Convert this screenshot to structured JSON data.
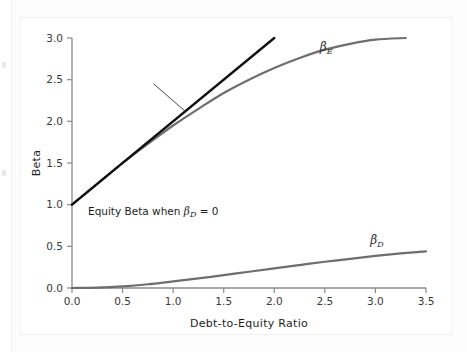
{
  "figure": {
    "background_color": "#ffffff",
    "frame_color": "#efefef"
  },
  "chart_data": {
    "type": "line",
    "title": "",
    "xlabel": "Debt-to-Equity Ratio",
    "ylabel": "Beta",
    "xlim": [
      0.0,
      3.5
    ],
    "ylim": [
      0.0,
      3.0
    ],
    "xticks": [
      "0.0",
      "0.5",
      "1.0",
      "1.5",
      "2.0",
      "2.5",
      "3.0",
      "3.5"
    ],
    "yticks": [
      "0.0",
      "0.5",
      "1.0",
      "1.5",
      "2.0",
      "2.5",
      "3.0"
    ],
    "xtick_values": [
      0.0,
      0.5,
      1.0,
      1.5,
      2.0,
      2.5,
      3.0,
      3.5
    ],
    "ytick_values": [
      0.0,
      0.5,
      1.0,
      1.5,
      2.0,
      2.5,
      3.0
    ],
    "grid": false,
    "legend": "inline-labels",
    "series": [
      {
        "name": "Equity Beta when beta_D = 0",
        "label": "Equity Beta when βD = 0",
        "color": "#111111",
        "width": 2.4,
        "x": [
          0.0,
          0.25,
          0.5,
          0.75,
          1.0,
          1.25,
          1.5,
          1.75,
          2.0
        ],
        "values": [
          1.0,
          1.25,
          1.5,
          1.75,
          2.0,
          2.25,
          2.5,
          2.75,
          3.0
        ]
      },
      {
        "name": "beta_E",
        "label": "βE",
        "color": "#6e6e6e",
        "width": 2.2,
        "x": [
          0.0,
          0.25,
          0.5,
          0.75,
          1.0,
          1.25,
          1.5,
          1.75,
          2.0,
          2.25,
          2.5,
          2.75,
          3.0,
          3.3
        ],
        "values": [
          1.0,
          1.25,
          1.5,
          1.73,
          1.95,
          2.15,
          2.34,
          2.5,
          2.64,
          2.76,
          2.86,
          2.93,
          2.98,
          3.0
        ]
      },
      {
        "name": "beta_D",
        "label": "βD",
        "color": "#6e6e6e",
        "width": 2.2,
        "x": [
          0.0,
          0.25,
          0.5,
          0.75,
          1.0,
          1.25,
          1.5,
          1.75,
          2.0,
          2.25,
          2.5,
          2.75,
          3.0,
          3.25,
          3.5
        ],
        "values": [
          0.0,
          0.005,
          0.02,
          0.045,
          0.08,
          0.115,
          0.155,
          0.195,
          0.235,
          0.275,
          0.315,
          0.35,
          0.385,
          0.415,
          0.44
        ]
      }
    ],
    "annotations": [
      {
        "text": "Equity Beta when βD = 0",
        "text_main": "Equity Beta when ",
        "text_beta": "β",
        "text_sub": "D",
        "text_tail": " = 0",
        "x_text": 2.5,
        "y_text": 0.9,
        "leader_from": [
          1.45,
          2.33
        ],
        "leader_to": [
          1.62,
          2.12
        ]
      }
    ],
    "series_labels": [
      {
        "label_beta": "β",
        "label_sub": "E",
        "x": 2.45,
        "y": 2.85
      },
      {
        "label_beta": "β",
        "label_sub": "D",
        "x": 2.95,
        "y": 0.53
      }
    ]
  }
}
